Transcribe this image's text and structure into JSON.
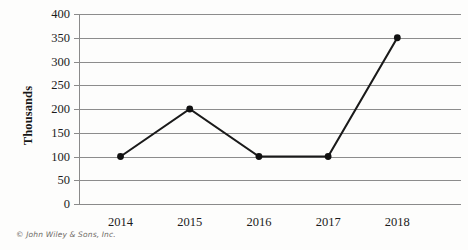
{
  "chart_data": {
    "type": "line",
    "title": "",
    "subtitle": "",
    "xlabel": "",
    "ylabel": "Thousands",
    "categories": [
      "2014",
      "2015",
      "2016",
      "2017",
      "2018"
    ],
    "values": [
      100,
      200,
      100,
      100,
      350
    ],
    "series": [
      {
        "name": "",
        "values": [
          100,
          200,
          100,
          100,
          350
        ]
      }
    ],
    "ylim": [
      0,
      400
    ],
    "ytick_step": 50,
    "yticks": [
      400,
      350,
      300,
      250,
      200,
      150,
      100,
      50,
      0
    ],
    "ytick_labels": [
      "400",
      "350",
      "300",
      "250",
      "200",
      "150",
      "100",
      "50",
      "0"
    ],
    "grid": true,
    "grid_axis": "y",
    "legend": false,
    "legend_position": "none",
    "markers": "filled-circle",
    "line_color": "#1a1a1a",
    "marker_color": "#111111",
    "grid_color": "#8c8c8c",
    "axis_color": "#8a8a8a",
    "background_color": "#fdfdfc"
  },
  "footer": {
    "copyright": "© John Wiley & Sons, Inc."
  }
}
